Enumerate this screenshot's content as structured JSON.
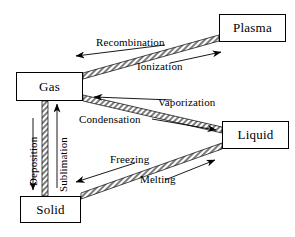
{
  "diagram": {
    "stroke_color": "#000000",
    "background_color": "#ffffff",
    "band_fill": "#8c8c8c",
    "nodes": [
      {
        "id": "plasma",
        "label": "Plasma"
      },
      {
        "id": "gas",
        "label": "Gas"
      },
      {
        "id": "liquid",
        "label": "Liquid"
      },
      {
        "id": "solid",
        "label": "Solid"
      }
    ],
    "transitions": [
      {
        "id": "recombination",
        "label": "Recombination",
        "from": "plasma",
        "to": "gas",
        "arrow_direction": "left"
      },
      {
        "id": "ionization",
        "label": "Ionization",
        "from": "gas",
        "to": "plasma",
        "arrow_direction": "right"
      },
      {
        "id": "vaporization",
        "label": "Vaporization",
        "from": "liquid",
        "to": "gas",
        "arrow_direction": "left"
      },
      {
        "id": "condensation",
        "label": "Condensation",
        "from": "gas",
        "to": "liquid",
        "arrow_direction": "right"
      },
      {
        "id": "freezing",
        "label": "Freezing",
        "from": "liquid",
        "to": "solid",
        "arrow_direction": "left"
      },
      {
        "id": "melting",
        "label": "Melting",
        "from": "solid",
        "to": "liquid",
        "arrow_direction": "right"
      },
      {
        "id": "deposition",
        "label": "Deposition",
        "from": "gas",
        "to": "solid",
        "arrow_direction": "down"
      },
      {
        "id": "sublimation",
        "label": "Sublimation",
        "from": "solid",
        "to": "gas",
        "arrow_direction": "up"
      }
    ]
  }
}
